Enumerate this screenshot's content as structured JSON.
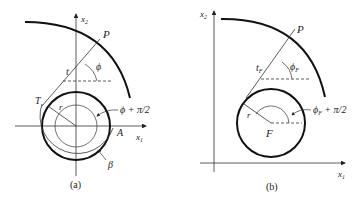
{
  "figure": {
    "panel_a": {
      "caption": "(a)",
      "labels": {
        "x2": "x",
        "x2_sub": "2",
        "x1": "x",
        "x1_sub": "1",
        "P": "P",
        "phi": "ϕ",
        "t": "t",
        "T": "T",
        "r": "r",
        "angle": "ϕ + π/2",
        "A": "A",
        "beta": "β"
      }
    },
    "panel_b": {
      "caption": "(b)",
      "labels": {
        "x2": "x",
        "x2_sub": "2",
        "x1": "x",
        "x1_sub": "1",
        "P": "P",
        "phiF": "ϕ",
        "phiF_sub": "F",
        "tF": "t",
        "tF_sub": "F",
        "r": "r",
        "F": "F",
        "angle_base": "ϕ",
        "angle_sub": "F",
        "angle_rest": " + π/2"
      }
    },
    "colors": {
      "stroke": "#111111",
      "thin": "#333333"
    }
  }
}
